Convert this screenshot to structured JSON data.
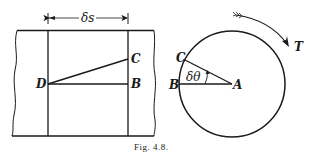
{
  "figure": {
    "caption": "Fig. 4.8.",
    "left_panel": {
      "dimension_label": "δs",
      "points": {
        "C": "C",
        "D": "D",
        "B": "B"
      }
    },
    "right_panel": {
      "angle_label": "δθ",
      "torque_label": "T",
      "points": {
        "A": "A",
        "B": "B",
        "C": "C"
      }
    }
  },
  "colors": {
    "ink": "#1a1a1a",
    "background": "#ffffff"
  }
}
